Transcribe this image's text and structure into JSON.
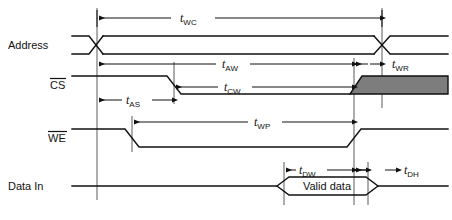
{
  "diagram": {
    "width": 452,
    "height": 220,
    "background_color": "#ffffff",
    "line_color": "#111111",
    "shade_color": "#7d7d7d",
    "reference_line_color": "#5a5a5a"
  },
  "signals": [
    {
      "id": "address",
      "label": "Address",
      "overbar": false,
      "row_y": 45
    },
    {
      "id": "cs",
      "label": "CS",
      "overbar": true,
      "row_y": 85
    },
    {
      "id": "we",
      "label": "WE",
      "overbar": true,
      "row_y": 138
    },
    {
      "id": "data_in",
      "label": "Data In",
      "overbar": false,
      "row_y": 186
    }
  ],
  "timing_params": [
    {
      "id": "twc",
      "base": "t",
      "sub": "WC",
      "text": "tWC",
      "description": "write cycle time",
      "row": "address"
    },
    {
      "id": "taw",
      "base": "t",
      "sub": "AW",
      "text": "tAW",
      "description": "address valid to end of write",
      "row": "cs"
    },
    {
      "id": "twr",
      "base": "t",
      "sub": "WR",
      "text": "tWR",
      "description": "write recovery time",
      "row": "cs"
    },
    {
      "id": "tas",
      "base": "t",
      "sub": "AS",
      "text": "tAS",
      "description": "address setup time",
      "row": "cs"
    },
    {
      "id": "tcw",
      "base": "t",
      "sub": "CW",
      "text": "tCW",
      "description": "chip selection to end of write",
      "row": "cs"
    },
    {
      "id": "twp",
      "base": "t",
      "sub": "WP",
      "text": "tWP",
      "description": "write pulse width",
      "row": "we"
    },
    {
      "id": "tdw",
      "base": "t",
      "sub": "DW",
      "text": "tDW",
      "description": "data valid to end of write",
      "row": "data_in"
    },
    {
      "id": "tdh",
      "base": "t",
      "sub": "DH",
      "text": "tDH",
      "description": "data hold time",
      "row": "data_in"
    }
  ],
  "data_bus": {
    "valid_label": "Valid data"
  },
  "reference_lines": [
    {
      "id": "ref-address-start",
      "x": 97
    },
    {
      "id": "ref-cs-fall",
      "x": 174
    },
    {
      "id": "ref-we-fall",
      "x": 132
    },
    {
      "id": "ref-we-rise",
      "x": 354
    },
    {
      "id": "ref-address-end",
      "x": 382
    },
    {
      "id": "ref-data-valid-start",
      "x": 284
    },
    {
      "id": "ref-data-hold-end",
      "x": 368
    }
  ]
}
